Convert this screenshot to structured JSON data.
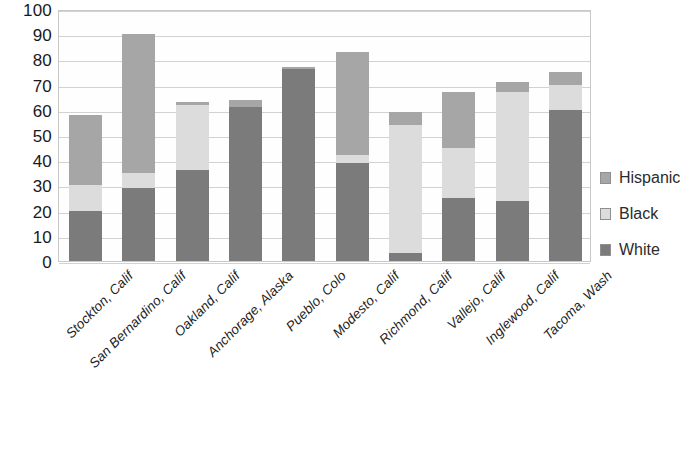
{
  "chart_data": {
    "type": "bar",
    "stacked": true,
    "title": "",
    "subtitle": "",
    "xlabel": "",
    "ylabel": "",
    "ylim": [
      0,
      100
    ],
    "ytick_step": 10,
    "yticks": [
      "100",
      "90",
      "80",
      "70",
      "60",
      "50",
      "40",
      "30",
      "20",
      "10",
      "0"
    ],
    "grid": true,
    "legend_position": "right",
    "categories": [
      "Stockton, Calif",
      "San Bernardino, Calif",
      "Oakland, Calif",
      "Anchorage, Alaska",
      "Pueblo, Colo",
      "Modesto, Calif",
      "Richmond, Calif",
      "Vallejo, Calif",
      "Inglewood, Calif",
      "Tacoma, Wash"
    ],
    "series": [
      {
        "name": "White",
        "color": "#7b7b7b",
        "values": [
          20,
          29,
          36,
          61,
          76,
          39,
          3,
          25,
          24,
          60
        ]
      },
      {
        "name": "Black",
        "color": "#dcdcdc",
        "values": [
          10,
          6,
          26,
          0,
          0,
          3,
          51,
          20,
          43,
          10
        ]
      },
      {
        "name": "Hispanic",
        "color": "#a6a6a6",
        "values": [
          28,
          55,
          1,
          3,
          1,
          41,
          5,
          22,
          4,
          5
        ]
      }
    ],
    "totals": [
      58,
      90,
      63,
      64,
      77,
      83,
      59,
      67,
      71,
      75
    ]
  },
  "legend": {
    "items": [
      {
        "label": "Hispanic",
        "color": "#a6a6a6"
      },
      {
        "label": "Black",
        "color": "#dcdcdc"
      },
      {
        "label": "White",
        "color": "#7b7b7b"
      }
    ]
  },
  "colors": {
    "plot_border": "#c8c8c8",
    "gridline": "#d2d2d2",
    "background": "#ffffff",
    "text": "#1a1a1a"
  }
}
